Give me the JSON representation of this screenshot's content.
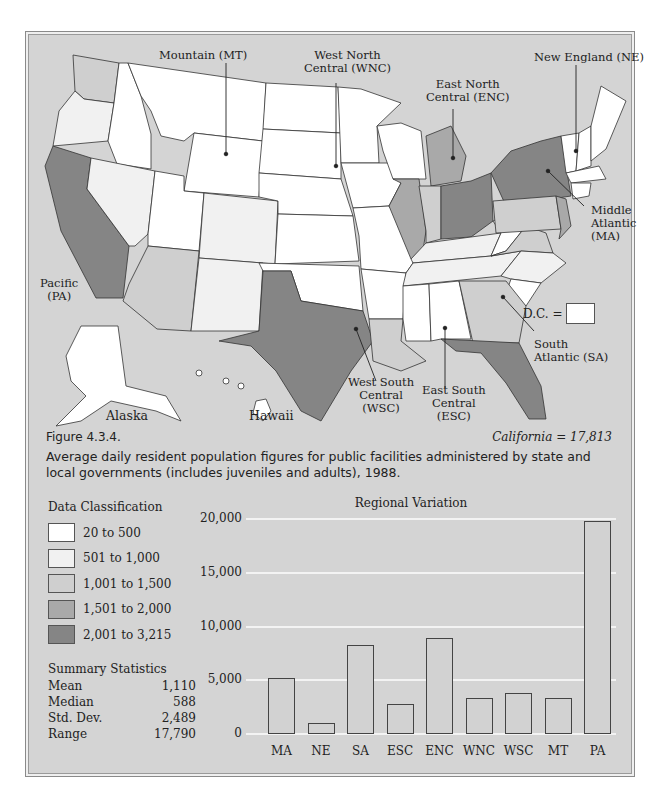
{
  "figure": {
    "number": "Figure 4.3.4.",
    "caption": "Average daily resident population figures for public facilities administered by state and local governments (includes juveniles and adults), 1988.",
    "california_note": "California = 17,813",
    "dc_label": "D.C. ="
  },
  "map": {
    "region_labels": {
      "mountain": "Mountain (MT)",
      "wnc_1": "West North",
      "wnc_2": "Central (WNC)",
      "enc_1": "East North",
      "enc_2": "Central (ENC)",
      "ne": "New England (NE)",
      "ma_1": "Middle",
      "ma_2": "Atlantic",
      "ma_3": "(MA)",
      "pa_1": "Pacific",
      "pa_2": "(PA)",
      "sa_1": "South",
      "sa_2": "Atlantic (SA)",
      "wsc_1": "West South",
      "wsc_2": "Central",
      "wsc_3": "(WSC)",
      "esc_1": "East South",
      "esc_2": "Central",
      "esc_3": "(ESC)",
      "alaska": "Alaska",
      "hawaii": "Hawaii"
    }
  },
  "legend": {
    "title": "Data Classification",
    "classes": [
      {
        "label": "20 to 500",
        "color": "#ffffff"
      },
      {
        "label": "501 to 1,000",
        "color": "#f1f1f1"
      },
      {
        "label": "1,001 to 1,500",
        "color": "#cfcfcf"
      },
      {
        "label": "1,501 to 2,000",
        "color": "#a9a9a9"
      },
      {
        "label": "2,001 to 3,215",
        "color": "#858585"
      }
    ]
  },
  "summary": {
    "title": "Summary Statistics",
    "rows": [
      {
        "label": "Mean",
        "value": "1,110"
      },
      {
        "label": "Median",
        "value": "588"
      },
      {
        "label": "Std. Dev.",
        "value": "2,489"
      },
      {
        "label": "Range",
        "value": "17,790"
      }
    ]
  },
  "chart_data": {
    "type": "bar",
    "title": "Regional Variation",
    "categories": [
      "MA",
      "NE",
      "SA",
      "ESC",
      "ENC",
      "WNC",
      "WSC",
      "MT",
      "PA"
    ],
    "values": [
      5250,
      1050,
      8300,
      2750,
      8900,
      3350,
      3850,
      3350,
      19800
    ],
    "ylim": [
      0,
      20000
    ],
    "yticks": [
      "0",
      "5,000",
      "10,000",
      "15,000",
      "20,000"
    ],
    "xlabel": "",
    "ylabel": "",
    "grid": true
  }
}
